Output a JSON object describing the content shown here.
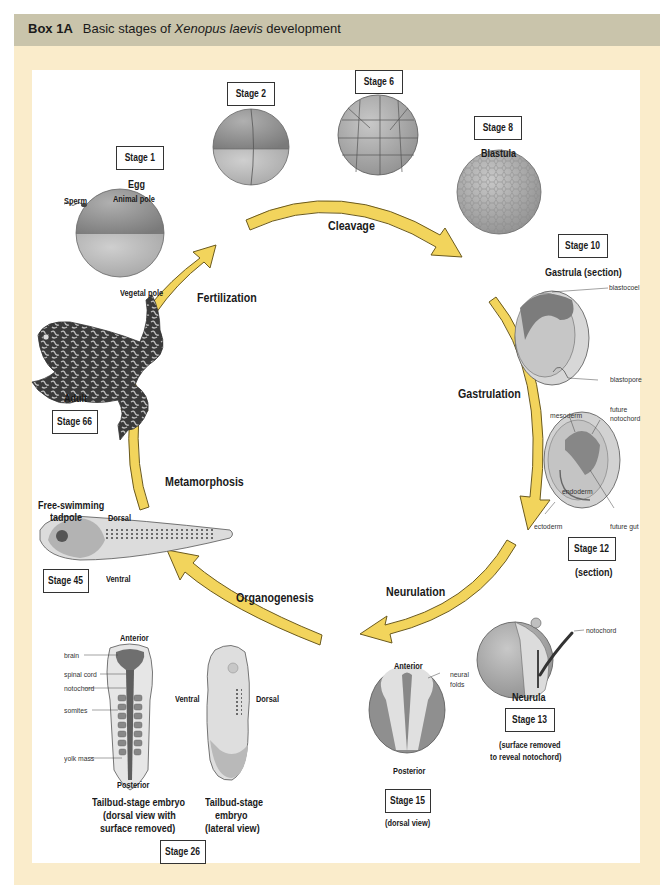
{
  "header": {
    "box_label": "Box 1A",
    "title_pre": "Basic stages of ",
    "title_italic": "Xenopus laevis",
    "title_post": " development"
  },
  "colors": {
    "header_band": "#c9c4ab",
    "frame": "#faeccb",
    "arrow_fill": "#f2d45c",
    "arrow_stroke": "#6b5a1e",
    "embryo_gray": "#9a9a9a"
  },
  "processes": {
    "fertilization": "Fertilization",
    "cleavage": "Cleavage",
    "gastrulation": "Gastrulation",
    "neurulation": "Neurulation",
    "organogenesis": "Organogenesis",
    "metamorphosis": "Metamorphosis"
  },
  "stages": {
    "s1": {
      "label": "Stage 1",
      "name": "Egg",
      "animal_pole": "Animal pole",
      "vegetal_pole": "Vegetal pole",
      "sperm": "Sperm"
    },
    "s2": {
      "label": "Stage 2"
    },
    "s6": {
      "label": "Stage 6"
    },
    "s8": {
      "label": "Stage 8",
      "name": "Blastula"
    },
    "s10": {
      "label": "Stage 10",
      "name": "Gastrula (section)",
      "blastocoel": "blastocoel",
      "blastopore": "blastopore"
    },
    "s12": {
      "label": "Stage 12",
      "note": "(section)",
      "mesoderm": "mesoderm",
      "future_notochord_1": "future",
      "future_notochord_2": "notochord",
      "endoderm": "endoderm",
      "ectoderm": "ectoderm",
      "future_gut": "future gut"
    },
    "s13": {
      "label": "Stage 13",
      "name": "Neurula",
      "notochord": "notochord",
      "note_1": "(surface removed",
      "note_2": "to reveal notochord)"
    },
    "s15": {
      "label": "Stage 15",
      "note": "(dorsal view)",
      "anterior": "Anterior",
      "posterior": "Posterior",
      "neural_1": "neural",
      "neural_2": "folds"
    },
    "s26": {
      "label": "Stage 26",
      "anterior": "Anterior",
      "posterior": "Posterior",
      "parts": [
        "brain",
        "spinal cord",
        "notochord",
        "somites",
        "yolk mass"
      ],
      "dorsal_caption": [
        "Tailbud-stage embryo",
        "(dorsal view with",
        "surface removed)"
      ],
      "lateral_caption": [
        "Tailbud-stage",
        "embryo",
        "(lateral view)"
      ],
      "ventral": "Ventral",
      "dorsal": "Dorsal"
    },
    "s45": {
      "label": "Stage 45",
      "name_1": "Free-swimming",
      "name_2": "tadpole",
      "dorsal": "Dorsal",
      "ventral": "Ventral"
    },
    "s66": {
      "label": "Stage 66",
      "name": "Adult"
    }
  }
}
